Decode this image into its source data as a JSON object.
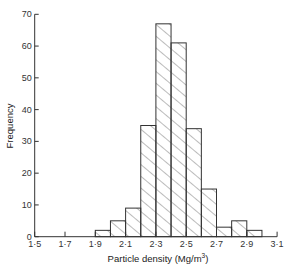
{
  "chart_data": {
    "type": "bar",
    "title": "",
    "xlabel": "Particle density (Mg/m³)",
    "xlabel_main": "Particle density (Mg/m",
    "xlabel_sup": "3",
    "xlabel_end": ")",
    "ylabel": "Frequency",
    "xlim": [
      1.5,
      3.1
    ],
    "ylim": [
      0,
      70
    ],
    "bin_width": 0.1,
    "x_ticks": [
      1.5,
      1.7,
      1.9,
      2.1,
      2.3,
      2.5,
      2.7,
      2.9,
      3.1
    ],
    "x_tick_labels": [
      "1·5",
      "1·7",
      "1·9",
      "2·1",
      "2·3",
      "2·5",
      "2·7",
      "2·9",
      "3·1"
    ],
    "y_ticks": [
      0,
      10,
      20,
      30,
      40,
      50,
      60,
      70
    ],
    "y_tick_labels": [
      "0",
      "10",
      "20",
      "30",
      "40",
      "50",
      "60",
      "70"
    ],
    "categories": [
      "1.9-2.0",
      "2.0-2.1",
      "2.1-2.2",
      "2.2-2.3",
      "2.3-2.4",
      "2.4-2.5",
      "2.5-2.6",
      "2.6-2.7",
      "2.7-2.8",
      "2.8-2.9",
      "2.9-3.0"
    ],
    "bin_starts": [
      1.9,
      2.0,
      2.1,
      2.2,
      2.3,
      2.4,
      2.5,
      2.6,
      2.7,
      2.8,
      2.9
    ],
    "values": [
      2,
      5,
      9,
      35,
      67,
      61,
      34,
      15,
      3,
      5,
      2
    ],
    "grid": false,
    "legend": null,
    "fill": "diagonal hatching",
    "colors": {
      "line": "#333333",
      "hatch": "#555555",
      "background": "#ffffff"
    }
  }
}
